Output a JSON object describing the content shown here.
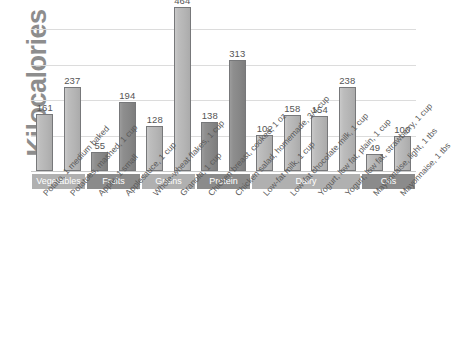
{
  "chart_data": {
    "type": "bar",
    "title": "",
    "xlabel": "",
    "ylabel": "Kilocalories",
    "ylim": [
      0,
      480
    ],
    "grid": true,
    "gridlines": [
      100,
      200,
      300,
      400
    ],
    "legend": "none",
    "categories": [
      "Potato, 1 medium baked",
      "Potatoes, mashed, 1 cup",
      "Apple, 1 small",
      "Applesauce, 1 cup",
      "Whole-wheat flakes, 1 cup",
      "Granola, 1 cup",
      "Chicken breast, cooked, 1 oz",
      "Chicken salad, homemade, 3/4 cup",
      "Low-fat milk, 1 cup",
      "Low-fat chocolate milk, 1 cup",
      "Yogurt, low fat, plain, 1 cup",
      "Yogurt, low fat, strawberry, 1 cup",
      "Mayonnaise, light, 1 tbs",
      "Mayonnaise, 1 tbs"
    ],
    "values": [
      161,
      237,
      55,
      194,
      128,
      464,
      138,
      313,
      102,
      158,
      154,
      238,
      49,
      100
    ],
    "bar_shades": [
      "light",
      "light",
      "dark",
      "dark",
      "light",
      "light",
      "dark",
      "dark",
      "light",
      "light",
      "light",
      "light",
      "light",
      "light"
    ],
    "groups": [
      {
        "label": "Vegetables",
        "span": 2,
        "shade": "lt"
      },
      {
        "label": "Fruits",
        "span": 2,
        "shade": "dk"
      },
      {
        "label": "Grains",
        "span": 2,
        "shade": "lt"
      },
      {
        "label": "Protein",
        "span": 2,
        "shade": "dk"
      },
      {
        "label": "Dairy",
        "span": 4,
        "shade": "lt"
      },
      {
        "label": "Oils",
        "span": 2,
        "shade": "dk"
      }
    ],
    "colors": {
      "bar_light": "#b4b4b4",
      "bar_dark": "#868686",
      "bar_border": "#77787a",
      "gridline": "#dcdcdc",
      "band_light": "#b0b0b0",
      "band_dark": "#8b8b8b",
      "axis_title": "#8d8d8d",
      "label_text": "#555555",
      "background": "#ffffff"
    }
  }
}
